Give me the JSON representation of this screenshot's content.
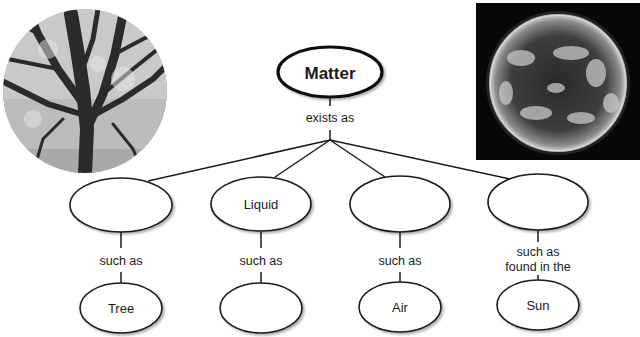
{
  "diagram": {
    "root": {
      "label": "Matter"
    },
    "root_link": {
      "label": "exists as"
    },
    "states": [
      {
        "label": "",
        "link_label": "such as",
        "example": "Tree"
      },
      {
        "label": "Liquid",
        "link_label": "such as",
        "example": ""
      },
      {
        "label": "",
        "link_label": "such as",
        "example": "Air"
      },
      {
        "label": "",
        "link_label_line1": "such as",
        "link_label_line2": "found in the",
        "example": "Sun"
      }
    ],
    "images": [
      {
        "name": "tree-photo",
        "description": "grayscale photo of a large tree, circular crop"
      },
      {
        "name": "sun-photo",
        "description": "photo of the Sun on black background"
      }
    ],
    "colors": {
      "stroke": "#1a1a1a",
      "background": "#ffffff"
    }
  }
}
